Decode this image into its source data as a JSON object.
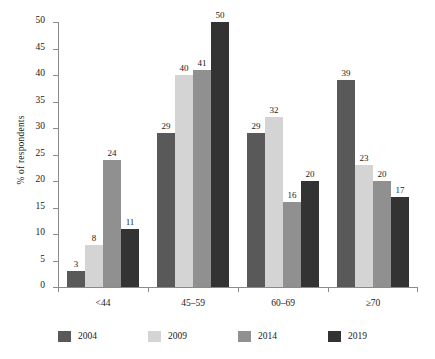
{
  "chart_data": {
    "type": "bar",
    "title": "",
    "xlabel": "",
    "ylabel": "% of respondents",
    "categories": [
      "<44",
      "45–59",
      "60–69",
      "≥70"
    ],
    "series": [
      {
        "name": "2004",
        "color": "#595959",
        "values": [
          3,
          29,
          29,
          39
        ]
      },
      {
        "name": "2009",
        "color": "#d4d4d4",
        "values": [
          8,
          40,
          32,
          23
        ]
      },
      {
        "name": "2014",
        "color": "#909090",
        "values": [
          24,
          41,
          16,
          20
        ]
      },
      {
        "name": "2019",
        "color": "#333333",
        "values": [
          11,
          50,
          20,
          17
        ]
      }
    ],
    "ylim": [
      0,
      50
    ],
    "yticks": [
      0,
      5,
      10,
      15,
      20,
      25,
      30,
      35,
      40,
      45,
      50
    ],
    "grid": false,
    "legend_position": "bottom",
    "value_labels": true
  },
  "axes": {
    "ylabel_text": "% of respondents"
  }
}
